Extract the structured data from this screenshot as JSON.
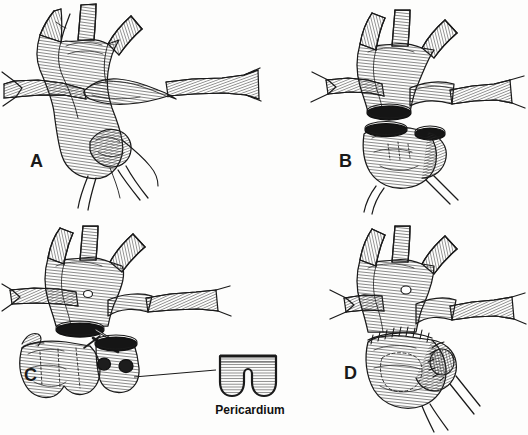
{
  "figure": {
    "background_color": "#fdfdfc",
    "ink_color": "#1a1a1a",
    "width": 528,
    "height": 435,
    "style": "pen-and-ink line hatching medical illustration"
  },
  "panels": [
    {
      "id": "A",
      "label": "A",
      "description": "Intact aortic arch with three brachiocephalic branches, ascending aorta, aortic root and main pulmonary artery crossing anteriorly with left and right pulmonary artery branches"
    },
    {
      "id": "B",
      "label": "B",
      "description": "Ascending aorta transected; proximal aortic root separated from distal arch showing two open dark elliptical lumens"
    },
    {
      "id": "C",
      "label": "C",
      "description": "Aortic root excised with coronary artery buttons mobilized; scissors dividing tissue; pericardial patch shown in inset"
    },
    {
      "id": "D",
      "label": "D",
      "description": "Completed reconstruction with running suture lines at proximal and distal anastomoses and reimplanted coronary buttons"
    }
  ],
  "annotations": {
    "pericardium_label": "Pericardium",
    "leader_line": {
      "from_panel": "C",
      "to": "pericardium-inset"
    }
  }
}
